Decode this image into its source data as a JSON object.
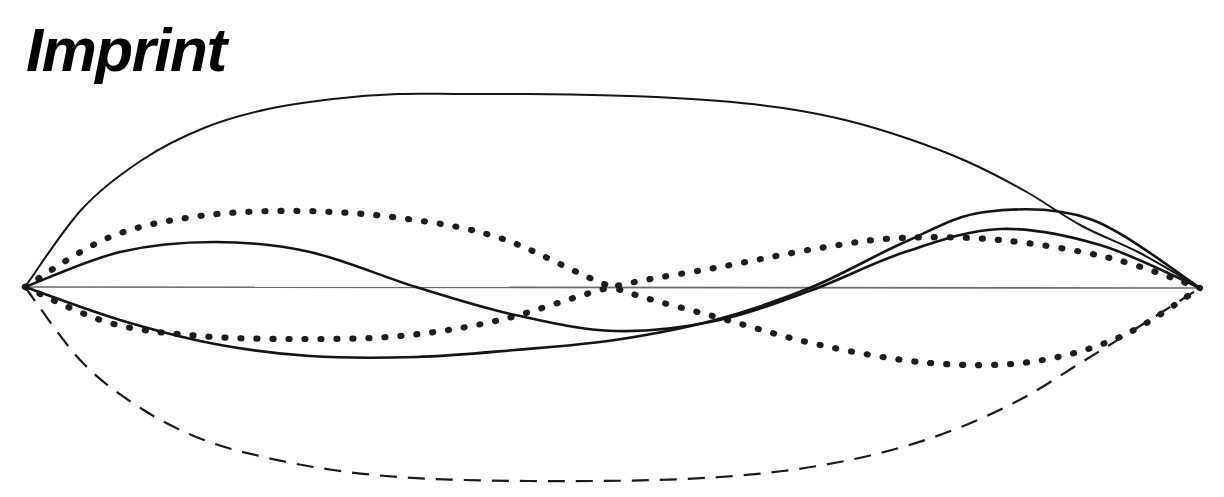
{
  "page": {
    "title": "Imprint",
    "background_color": "#ffffff",
    "width": 1224,
    "height": 497
  },
  "heading": {
    "text": "Imprint",
    "color": "#000000",
    "style": "bold-italic"
  },
  "chart_data": {
    "type": "line",
    "title": "",
    "subtitle": "",
    "xlabel": "",
    "ylabel": "",
    "grid": false,
    "legend": null,
    "axis": {
      "baseline_y": 287,
      "x_start": 25,
      "x_end": 1200,
      "color": "#6a6a6a",
      "width_px": 1.6
    },
    "anchors": {
      "left": {
        "x": 25,
        "y": 287
      },
      "right": {
        "x": 1200,
        "y": 288
      }
    },
    "xlim": [
      25,
      1200
    ],
    "ylim": [
      94,
      481
    ],
    "series": [
      {
        "name": "mode-1-positive",
        "style": "solid",
        "color": "#141414",
        "stroke_width": 2.0,
        "half_periods": 1,
        "amplitude": 193,
        "direction": "up",
        "peak": {
          "x": 612,
          "y": 94
        },
        "x": [
          25,
          82,
          142,
          204,
          268,
          333,
          398,
          463,
          528,
          592,
          656,
          720,
          783,
          845,
          906,
          966,
          1025,
          1082,
          1140,
          1200
        ],
        "y": [
          287,
          209,
          160,
          128,
          109,
          99,
          94,
          94,
          94,
          95,
          97,
          101,
          108,
          120,
          138,
          161,
          191,
          226,
          253,
          288
        ]
      },
      {
        "name": "mode-1-negative",
        "style": "dashed",
        "color": "#1a1a1a",
        "stroke_width": 2.2,
        "dash_pattern": "17 11",
        "half_periods": 1,
        "amplitude": 194,
        "direction": "down",
        "trough": {
          "x": 615,
          "y": 481
        },
        "x": [
          25,
          82,
          142,
          204,
          268,
          333,
          398,
          463,
          528,
          592,
          656,
          720,
          783,
          845,
          906,
          966,
          1025,
          1082,
          1140,
          1200
        ],
        "y": [
          287,
          362,
          409,
          440,
          458,
          470,
          477,
          480,
          481,
          481,
          480,
          477,
          471,
          461,
          446,
          425,
          397,
          362,
          326,
          288
        ]
      },
      {
        "name": "mode-2-solid-a",
        "style": "solid",
        "color": "#141414",
        "stroke_width": 2.6,
        "half_periods": 2,
        "amplitude": 46,
        "direction": "up-then-down",
        "peak": {
          "x": 215,
          "y": 242
        },
        "zero_crossing": {
          "x": 416,
          "y": 287
        },
        "trough": {
          "x": 615,
          "y": 331
        },
        "x": [
          25,
          120,
          215,
          310,
          416,
          515,
          615,
          715,
          812,
          905,
          1000,
          1100,
          1200
        ],
        "y": [
          287,
          252,
          242,
          252,
          287,
          315,
          331,
          321,
          290,
          252,
          229,
          245,
          288
        ]
      },
      {
        "name": "mode-2-solid-b",
        "style": "solid",
        "color": "#141414",
        "stroke_width": 2.6,
        "half_periods": 2,
        "amplitude": 72,
        "direction": "down-then-up",
        "trough": {
          "x": 340,
          "y": 357
        },
        "zero_crossing": {
          "x": 812,
          "y": 287
        },
        "peak": {
          "x": 985,
          "y": 212
        },
        "x": [
          25,
          120,
          215,
          310,
          416,
          515,
          615,
          715,
          812,
          905,
          985,
          1090,
          1200
        ],
        "y": [
          287,
          320,
          344,
          356,
          357,
          350,
          340,
          320,
          287,
          242,
          212,
          219,
          288
        ]
      },
      {
        "name": "mode-2-dotted-a",
        "style": "dotted",
        "color": "#1d1d1d",
        "stroke_width": 6.2,
        "dash_pattern": "1 15",
        "half_periods": 2,
        "amplitude": 76,
        "direction": "up-then-down",
        "peak": {
          "x": 300,
          "y": 211
        },
        "zero_crossing": {
          "x": 612,
          "y": 287
        },
        "trough": {
          "x": 930,
          "y": 363
        },
        "x": [
          25,
          110,
          200,
          300,
          400,
          500,
          612,
          720,
          820,
          930,
          1030,
          1120,
          1200
        ],
        "y": [
          287,
          237,
          216,
          211,
          218,
          238,
          287,
          318,
          345,
          363,
          362,
          337,
          288
        ]
      },
      {
        "name": "mode-2-dotted-b",
        "style": "dotted",
        "color": "#1d1d1d",
        "stroke_width": 6.2,
        "dash_pattern": "1 15",
        "half_periods": 2,
        "amplitude": 52,
        "direction": "down-then-up",
        "trough": {
          "x": 300,
          "y": 339
        },
        "zero_crossing": {
          "x": 612,
          "y": 287
        },
        "peak": {
          "x": 900,
          "y": 238
        },
        "x": [
          25,
          110,
          200,
          300,
          400,
          500,
          612,
          720,
          820,
          900,
          1000,
          1110,
          1200
        ],
        "y": [
          287,
          323,
          336,
          339,
          336,
          320,
          287,
          267,
          248,
          238,
          240,
          258,
          288
        ]
      }
    ],
    "annotations": []
  }
}
